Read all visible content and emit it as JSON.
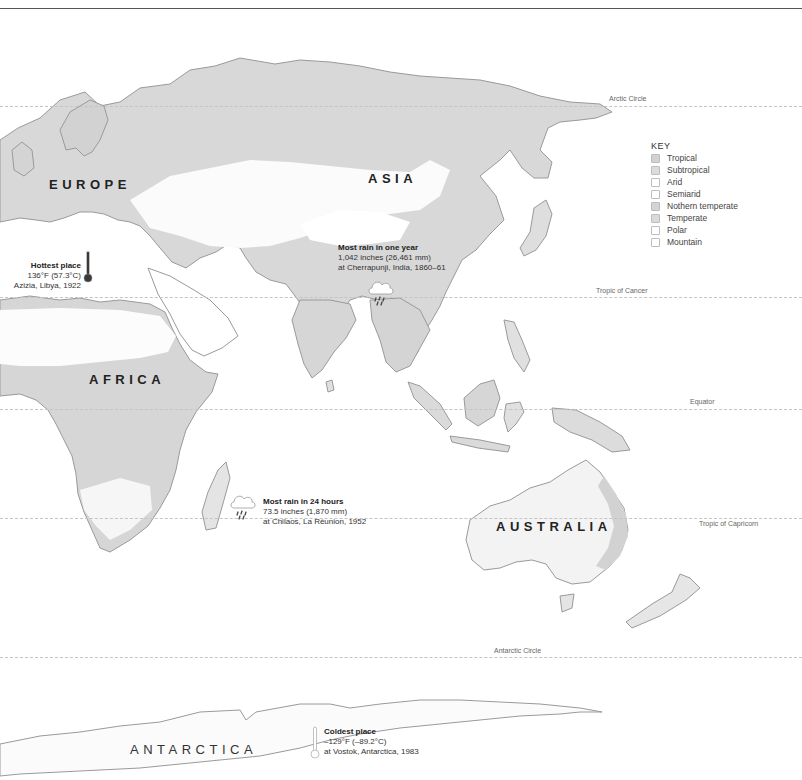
{
  "map": {
    "continents": [
      {
        "id": "europe",
        "label": "EUROPE"
      },
      {
        "id": "asia",
        "label": "ASIA"
      },
      {
        "id": "africa",
        "label": "AFRICA"
      },
      {
        "id": "australia",
        "label": "AUSTRALIA"
      },
      {
        "id": "antarctica",
        "label": "ANTARCTICA"
      }
    ],
    "latitude_lines": [
      {
        "id": "arctic",
        "label": "Arctic Circle"
      },
      {
        "id": "cancer",
        "label": "Tropic of Cancer"
      },
      {
        "id": "equator",
        "label": "Equator"
      },
      {
        "id": "capricorn",
        "label": "Tropic of Capricorn"
      },
      {
        "id": "antarctic",
        "label": "Antarctic Circle"
      }
    ],
    "colors": {
      "tropical": "#c9c9c9",
      "subtropical": "#d6d6d6",
      "arid": "#ffffff",
      "semiarid": "#f3f3f3",
      "northern_temperate": "#d0d0d0",
      "temperate": "#dadada",
      "polar": "#fbfbfb",
      "mountain": "#ffffff",
      "coast": "#9a9a9a"
    }
  },
  "key": {
    "title": "KEY",
    "items": [
      {
        "label": "Tropical",
        "color": "#d2d2d2"
      },
      {
        "label": "Subtropical",
        "color": "#dcdcdc"
      },
      {
        "label": "Arid",
        "color": "#ffffff"
      },
      {
        "label": "Semiarid",
        "color": "#ffffff"
      },
      {
        "label": "Nothern temperate",
        "color": "#d4d4d4"
      },
      {
        "label": "Temperate",
        "color": "#dadada"
      },
      {
        "label": "Polar",
        "color": "#ffffff"
      },
      {
        "label": "Mountain",
        "color": "#ffffff"
      }
    ]
  },
  "records": {
    "hottest": {
      "icon": "thermometer-hot-icon",
      "title": "Hottest place",
      "line1": "136°F (57.3°C)",
      "line2": "Azizia, Libya, 1922"
    },
    "rain_year": {
      "icon": "rain-cloud-icon",
      "title": "Most rain in one year",
      "line1": "1,042 inches (26,461 mm)",
      "line2": "at Cherrapunji, India, 1860–61"
    },
    "rain_24h": {
      "icon": "rain-cloud-icon",
      "title": "Most rain in 24 hours",
      "line1": "73.5 inches (1,870 mm)",
      "line2": "at Chilaos, La Réunion, 1952"
    },
    "coldest": {
      "icon": "thermometer-cold-icon",
      "title": "Coldest place",
      "line1": "–129°F (–89.2°C)",
      "line2": "at Vostok, Antarctica, 1983"
    }
  }
}
